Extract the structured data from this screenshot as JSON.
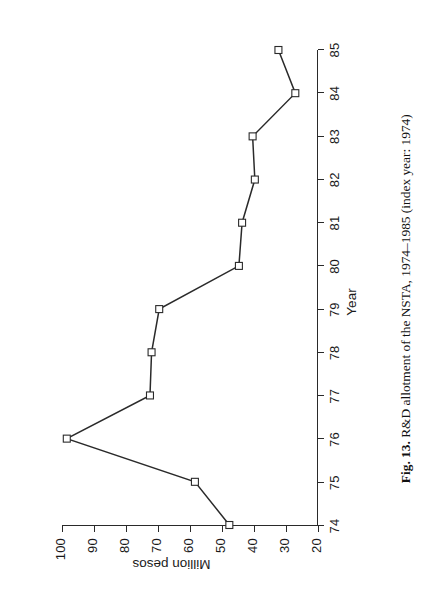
{
  "figure": {
    "caption_label": "Fig. 13.",
    "caption_text": "R&D allotment of the NSTA, 1974–1985 (index year: 1974)",
    "orientation": "rotated-90-ccw",
    "line_color": "#2a2a2a",
    "marker_fill": "#ffffff",
    "marker_stroke": "#2a2a2a",
    "background": "#ffffff"
  },
  "chart_data": {
    "type": "line",
    "title": "R&D allotment of the NSTA, 1974–1985 (index year: 1974)",
    "xlabel": "Year",
    "ylabel": "Million pesos",
    "categories": [
      "74",
      "75",
      "76",
      "77",
      "78",
      "79",
      "80",
      "81",
      "82",
      "83",
      "84",
      "85"
    ],
    "x": [
      74,
      75,
      76,
      77,
      78,
      79,
      80,
      81,
      82,
      83,
      84,
      85
    ],
    "values": [
      47.5,
      58.3,
      98.5,
      72.4,
      71.9,
      69.5,
      44.5,
      43.5,
      39.5,
      40.2,
      26.8,
      32.1
    ],
    "series": [
      {
        "name": "R&D allotment",
        "values": [
          47.5,
          58.3,
          98.5,
          72.4,
          71.9,
          69.5,
          44.5,
          43.5,
          39.5,
          40.2,
          26.8,
          32.1
        ]
      }
    ],
    "xlim": [
      74,
      85
    ],
    "ylim": [
      20,
      100
    ],
    "xticks": [
      "74",
      "75",
      "76",
      "77",
      "78",
      "79",
      "80",
      "81",
      "82",
      "83",
      "84",
      "85"
    ],
    "yticks": [
      "20",
      "30",
      "40",
      "50",
      "60",
      "70",
      "80",
      "90",
      "100"
    ],
    "ytick_values": [
      20,
      30,
      40,
      50,
      60,
      70,
      80,
      90,
      100
    ],
    "grid": false,
    "legend": "none",
    "marker": "square"
  }
}
